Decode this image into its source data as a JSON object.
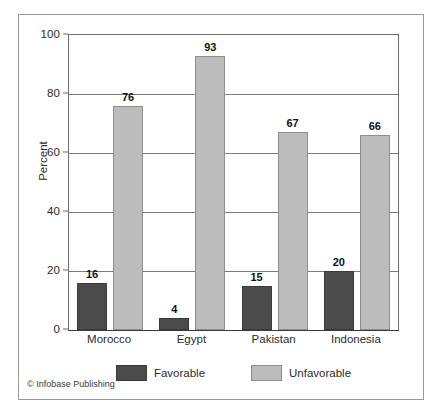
{
  "chart_data": {
    "type": "bar",
    "title": "",
    "xlabel": "",
    "ylabel": "Percent",
    "ylim": [
      0,
      100
    ],
    "yticks": [
      0,
      20,
      40,
      60,
      80,
      100
    ],
    "ytick_labels": [
      "0",
      "20",
      "40",
      "60",
      "80",
      "100"
    ],
    "grid": true,
    "legend_position": "bottom",
    "categories": [
      "Morocco",
      "Egypt",
      "Pakistan",
      "Indonesia"
    ],
    "series": [
      {
        "name": "Favorable",
        "color": "#4b4b4b",
        "values": [
          16,
          4,
          15,
          20
        ],
        "value_labels": [
          "16",
          "4",
          "15",
          "20"
        ]
      },
      {
        "name": "Unfavorable",
        "color": "#bcbcbc",
        "values": [
          76,
          93,
          67,
          66
        ],
        "value_labels": [
          "76",
          "93",
          "67",
          "66"
        ]
      }
    ]
  },
  "credit": "© Infobase Publishing",
  "colors": {
    "favorable": "#4b4b4b",
    "unfavorable": "#bcbcbc",
    "frame": "#9a9a9a",
    "axis": "#6d6d6d",
    "gridline": "#7c7c7c",
    "text": "#2b2b2b"
  }
}
